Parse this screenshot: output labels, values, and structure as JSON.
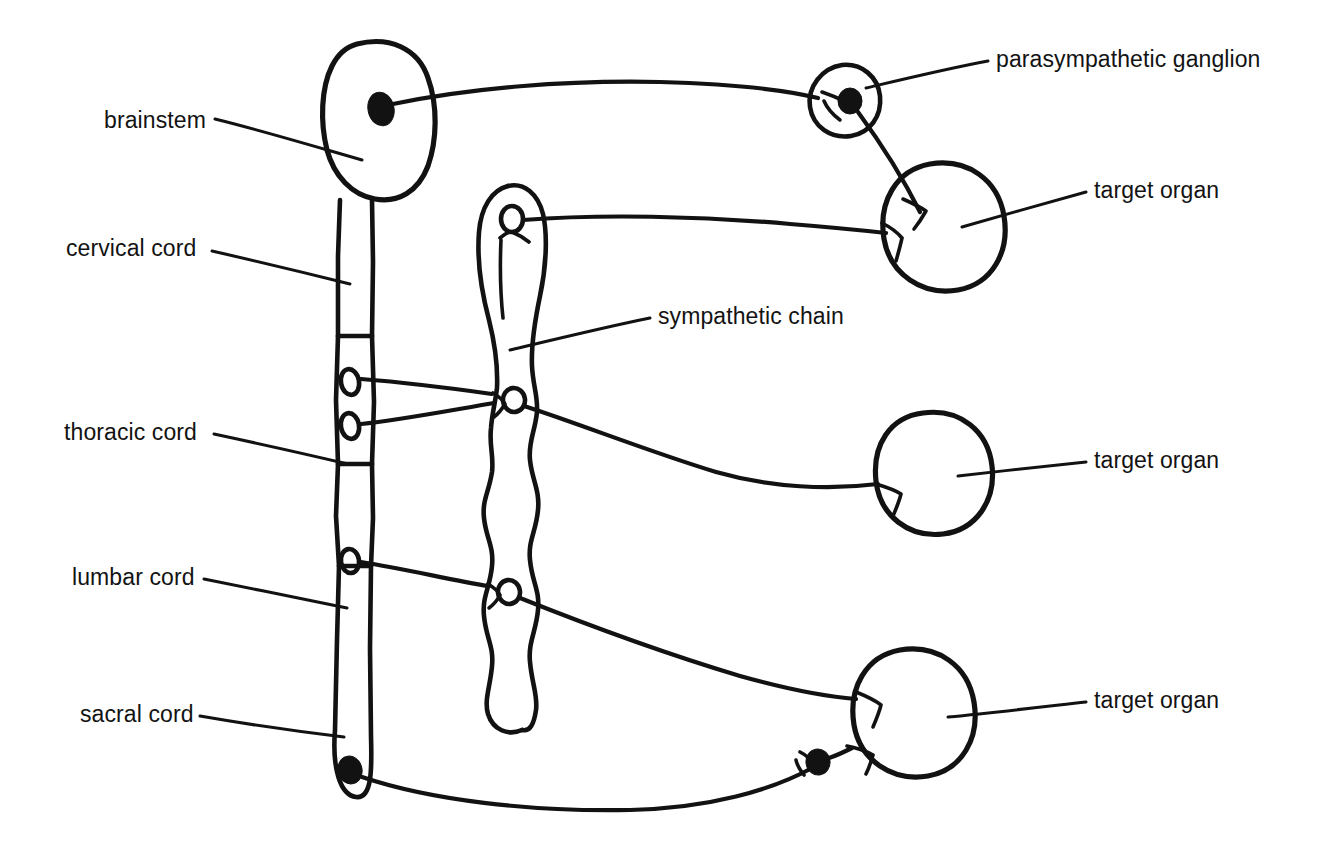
{
  "diagram": {
    "ink_color": "#121212",
    "background_color": "#ffffff",
    "labels": {
      "brainstem": "brainstem",
      "cervical_cord": "cervical cord",
      "thoracic_cord": "thoracic cord",
      "lumbar_cord": "lumbar cord",
      "sacral_cord": "sacral cord",
      "sympathetic_chain": "sympathetic chain",
      "parasympathetic_ganglion": "parasympathetic ganglion",
      "target_organ_top": "target organ",
      "target_organ_middle": "target organ",
      "target_organ_bottom": "target organ"
    },
    "structures": [
      {
        "name": "brainstem",
        "kind": "oval-body",
        "label": "brainstem",
        "has_filled_nucleus": true,
        "side": "left"
      },
      {
        "name": "spinal-cord",
        "kind": "segmented-column",
        "segments": [
          {
            "name": "cervical cord",
            "roots": 0
          },
          {
            "name": "thoracic cord",
            "roots": 2
          },
          {
            "name": "lumbar cord",
            "roots": 1
          },
          {
            "name": "sacral cord",
            "roots": 0,
            "has_filled_nucleus": true
          }
        ]
      },
      {
        "name": "sympathetic-chain",
        "kind": "beaded-chain",
        "label": "sympathetic chain",
        "ganglia": 3,
        "note": "superior cervical ganglion at top, mid-thoracic ganglion, lumbar ganglion"
      },
      {
        "name": "parasympathetic-ganglion",
        "kind": "small-ring-with-synapse",
        "label": "parasympathetic ganglion",
        "has_filled_nucleus": true
      },
      {
        "name": "target-organ-top",
        "kind": "circle-organ",
        "label": "target organ",
        "inputs": 2
      },
      {
        "name": "target-organ-middle",
        "kind": "circle-organ",
        "label": "target organ",
        "inputs": 1
      },
      {
        "name": "target-organ-bottom",
        "kind": "circle-organ",
        "label": "target organ",
        "inputs": 2
      }
    ],
    "pathways": [
      {
        "name": "cranial-parasympathetic",
        "from": "brainstem",
        "via": "parasympathetic ganglion",
        "to": "target organ"
      },
      {
        "name": "cervical-sympathetic",
        "from": "sympathetic chain superior cervical ganglion",
        "to": "target organ"
      },
      {
        "name": "thoracic-sympathetic",
        "from": "thoracic cord",
        "via": "sympathetic chain ganglion",
        "to": "target organ"
      },
      {
        "name": "lumbar-sympathetic",
        "from": "lumbar cord",
        "via": "sympathetic chain ganglion",
        "to": "target organ"
      },
      {
        "name": "sacral-parasympathetic",
        "from": "sacral cord",
        "via": "terminal ganglion",
        "to": "target organ"
      }
    ]
  }
}
